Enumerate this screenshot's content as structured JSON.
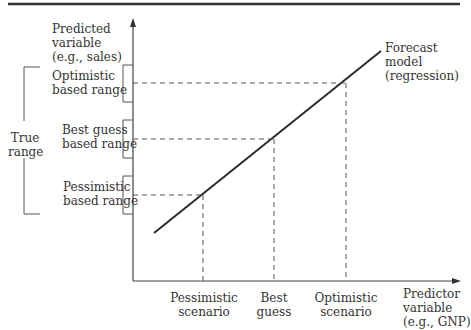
{
  "diagram": {
    "type": "forecast-scenario-diagram",
    "y_axis_label": "Predicted\nvariable\n(e.g., sales)",
    "x_axis_label": "Predictor\nvariable\n(e.g., GNP)",
    "model_label": "Forecast\nmodel\n(regression)",
    "true_range_label": "True\nrange",
    "ranges": [
      {
        "label": "Optimistic\nbased range"
      },
      {
        "label": "Best guess\nbased range"
      },
      {
        "label": "Pessimistic\nbased range"
      }
    ],
    "scenarios": [
      {
        "label": "Pessimistic\nscenario"
      },
      {
        "label": "Best\nguess"
      },
      {
        "label": "Optimistic\nscenario"
      }
    ],
    "colors": {
      "line": "#2b2b2b",
      "dashed": "#555555",
      "rule": "#333333"
    }
  }
}
